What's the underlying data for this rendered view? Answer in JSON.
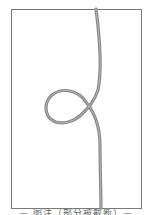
{
  "figure": {
    "frame": {
      "x": 11,
      "y": 9,
      "width": 130,
      "height": 199,
      "stroke": "#7a7a7a"
    },
    "curve": {
      "description": "Vertical rope/line with a single loop (overhand-style curl) on the left side",
      "stroke": "#8a8a8a",
      "highlight": "#c8c8c8",
      "width": 3
    },
    "caption": "— 图注（部分被截断）—"
  }
}
